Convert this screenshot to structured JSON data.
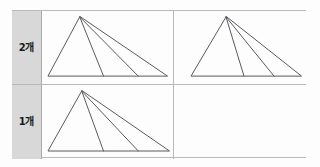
{
  "figure": {
    "type": "table-of-geometric-diagrams",
    "background_color": "#fdfdfd",
    "border_color": "#b9b9b9",
    "label_cell_color": "#d8d8d8",
    "stroke_color": "#59595e"
  },
  "rows": [
    {
      "id": "row-2",
      "label": "2개",
      "cells": [
        {
          "id": "cell-r1c1",
          "empty": false,
          "diagram": {
            "name": "triangle-with-two-cevians",
            "apex": [
              38,
              6
            ],
            "base_left": [
              6,
              66
            ],
            "base_right": [
              126,
              66
            ],
            "cevian_feet": [
              [
                62,
                66
              ],
              [
                97,
                66
              ]
            ],
            "sub_triangle_count": 3
          }
        },
        {
          "id": "cell-r1c2",
          "empty": false,
          "diagram": {
            "name": "triangle-with-two-cevians",
            "apex": [
              52,
              6
            ],
            "base_left": [
              17,
              66
            ],
            "base_right": [
              127,
              66
            ],
            "cevian_feet": [
              [
                70,
                66
              ],
              [
                100,
                66
              ]
            ],
            "sub_triangle_count": 3
          }
        }
      ]
    },
    {
      "id": "row-1",
      "label": "1개",
      "cells": [
        {
          "id": "cell-r2c1",
          "empty": false,
          "diagram": {
            "name": "triangle-with-two-cevians",
            "apex": [
              40,
              6
            ],
            "base_left": [
              6,
              66
            ],
            "base_right": [
              128,
              66
            ],
            "cevian_feet": [
              [
                62,
                66
              ],
              [
                97,
                66
              ]
            ],
            "sub_triangle_count": 3
          }
        },
        {
          "id": "cell-r2c2",
          "empty": true,
          "diagram": null
        }
      ]
    }
  ]
}
